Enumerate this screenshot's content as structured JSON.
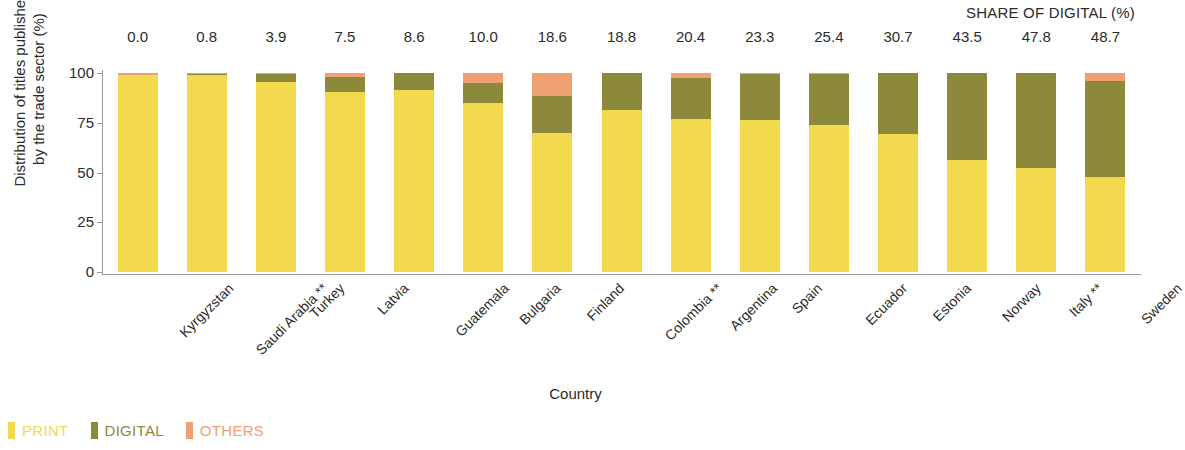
{
  "header": {
    "share_title": "SHARE OF DIGITAL (%)"
  },
  "axes": {
    "y_title_line1": "Distribution of titles published",
    "y_title_line2": "by the trade sector (%)",
    "x_title": "Country"
  },
  "legend": {
    "items": [
      {
        "label": "PRINT",
        "color": "#F2D94E"
      },
      {
        "label": "DIGITAL",
        "color": "#8C8A3A"
      },
      {
        "label": "OTHERS",
        "color": "#F0A173"
      }
    ]
  },
  "chart_data": {
    "type": "bar",
    "subtype": "stacked-percent",
    "title": "",
    "xlabel": "Country",
    "ylabel": "Distribution of titles published by the trade sector (%)",
    "ylim": [
      0,
      100
    ],
    "yticks": [
      0,
      25,
      50,
      75,
      100
    ],
    "ytick_labels": [
      "0",
      "25",
      "50",
      "75",
      "100"
    ],
    "grid": false,
    "legend_position": "bottom-left",
    "annotation_row_title": "SHARE OF DIGITAL (%)",
    "categories": [
      "Kyrgyzstan",
      "Saudi Arabia **",
      "Turkey",
      "Latvia",
      "Guatemala",
      "Bulgaria",
      "Finland",
      "Colombia **",
      "Argentina",
      "Spain",
      "Ecuador",
      "Estonia",
      "Norway",
      "Italy **",
      "Sweden"
    ],
    "share_of_digital": [
      "0.0",
      "0.8",
      "3.9",
      "7.5",
      "8.6",
      "10.0",
      "18.6",
      "18.8",
      "20.4",
      "23.3",
      "25.4",
      "30.7",
      "43.5",
      "47.8",
      "48.7"
    ],
    "series": [
      {
        "name": "PRINT",
        "color": "#F2D94E",
        "values": [
          99.0,
          98.8,
          95.6,
          90.5,
          91.4,
          85.0,
          70.0,
          81.2,
          77.0,
          76.6,
          74.0,
          69.3,
          56.5,
          52.2,
          47.5
        ]
      },
      {
        "name": "DIGITAL",
        "color": "#8C8A3A",
        "values": [
          0.0,
          0.8,
          3.9,
          7.5,
          8.6,
          10.0,
          18.6,
          18.8,
          20.4,
          23.3,
          25.4,
          30.7,
          43.5,
          47.8,
          48.7
        ]
      },
      {
        "name": "OTHERS",
        "color": "#F0A173",
        "values": [
          1.0,
          0.4,
          0.5,
          2.0,
          0.0,
          5.0,
          11.4,
          0.0,
          2.6,
          0.1,
          0.6,
          0.0,
          0.0,
          0.0,
          3.8
        ]
      }
    ]
  }
}
